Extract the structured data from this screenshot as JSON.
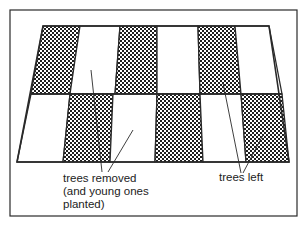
{
  "diagram": {
    "type": "coppicing-strip-felling",
    "colors": {
      "line": "#2a2a2a",
      "pattern_dark": "#1e1e1e",
      "pattern_light": "#ffffff",
      "background": "#ffffff"
    },
    "frame": {
      "x": 10,
      "y": 10,
      "width": 287,
      "height": 206
    },
    "field": {
      "top_y": 26,
      "middle_y": 94,
      "bottom_y": 162,
      "top_row_columns": [
        {
          "shade": "dark",
          "top": [
            43,
            80
          ],
          "bottom": [
            31,
            70
          ]
        },
        {
          "shade": "light",
          "top": [
            80,
            120
          ],
          "bottom": [
            70,
            115
          ]
        },
        {
          "shade": "dark",
          "top": [
            120,
            157
          ],
          "bottom": [
            115,
            157
          ]
        },
        {
          "shade": "light",
          "top": [
            157,
            198
          ],
          "bottom": [
            157,
            200
          ]
        },
        {
          "shade": "dark",
          "top": [
            198,
            235
          ],
          "bottom": [
            200,
            241
          ]
        },
        {
          "shade": "light",
          "top": [
            235,
            269
          ],
          "bottom": [
            241,
            282
          ]
        }
      ],
      "bottom_row_columns": [
        {
          "shade": "light",
          "top": [
            31,
            70
          ],
          "bottom": [
            17,
            63
          ]
        },
        {
          "shade": "dark",
          "top": [
            70,
            113
          ],
          "bottom": [
            63,
            110
          ]
        },
        {
          "shade": "light",
          "top": [
            113,
            157
          ],
          "bottom": [
            110,
            155
          ]
        },
        {
          "shade": "dark",
          "top": [
            157,
            200
          ],
          "bottom": [
            155,
            203
          ]
        },
        {
          "shade": "light",
          "top": [
            200,
            241
          ],
          "bottom": [
            203,
            246
          ]
        },
        {
          "shade": "dark",
          "top": [
            241,
            282
          ],
          "bottom": [
            246,
            289
          ]
        }
      ]
    },
    "labels": [
      {
        "id": "trees-removed",
        "lines": [
          "trees removed",
          "(and young ones",
          "planted)"
        ],
        "x": 63,
        "y": 182,
        "leaders": [
          {
            "x1": 91,
            "y1": 70,
            "x2": 102,
            "y2": 172
          },
          {
            "x1": 133,
            "y1": 130,
            "x2": 108,
            "y2": 172
          }
        ]
      },
      {
        "id": "trees-left",
        "lines": [
          "trees left"
        ],
        "x": 219,
        "y": 181,
        "leaders": [
          {
            "x1": 223,
            "y1": 83,
            "x2": 241,
            "y2": 173
          },
          {
            "x1": 263,
            "y1": 135,
            "x2": 243,
            "y2": 173
          }
        ]
      }
    ]
  }
}
